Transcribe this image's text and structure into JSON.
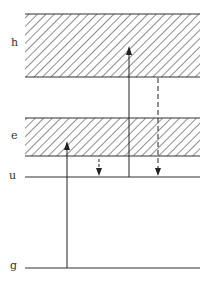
{
  "diagram": {
    "type": "energy-level diagram",
    "levels": [
      {
        "label": "h",
        "kind": "band",
        "top": 14,
        "bottom": 77
      },
      {
        "label": "e",
        "kind": "band",
        "top": 118,
        "bottom": 156
      },
      {
        "label": "u",
        "kind": "line",
        "y": 177
      },
      {
        "label": "g",
        "kind": "line",
        "y": 268
      }
    ],
    "transitions": [
      {
        "style": "solid",
        "direction": "up",
        "from": "g",
        "to": "e"
      },
      {
        "style": "solid",
        "direction": "up",
        "from": "u",
        "to": "h"
      },
      {
        "style": "dashed",
        "direction": "down",
        "from": "e",
        "to": "u"
      },
      {
        "style": "dashed",
        "direction": "down",
        "from": "h",
        "to": "u"
      }
    ]
  },
  "labels": {
    "h": "h",
    "e": "e",
    "u": "u",
    "g": "g"
  }
}
